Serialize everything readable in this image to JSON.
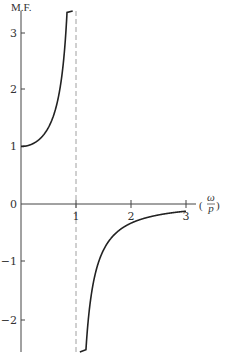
{
  "chart_data": {
    "type": "line",
    "title": "",
    "ylabel": "M.F.",
    "xlabel": "(ω/p)",
    "xlim": [
      0,
      3.1
    ],
    "ylim": [
      -2.6,
      3.35
    ],
    "grid": false,
    "legend": null,
    "x_ticks": [
      1,
      2,
      3
    ],
    "x_tick_labels": [
      "1",
      "2",
      "3"
    ],
    "y_ticks": [
      -2,
      -1,
      0,
      1,
      2,
      3
    ],
    "y_tick_labels": [
      "−2",
      "−1",
      "0",
      "1",
      "2",
      "3"
    ],
    "function": "M.F. = 1 / (1 − (ω/p)²)",
    "asymptote": {
      "x": 1,
      "style": "dashed"
    },
    "series": [
      {
        "name": "below resonance",
        "x": [
          0,
          0.2,
          0.4,
          0.5,
          0.6,
          0.7,
          0.8,
          0.85,
          0.9
        ],
        "y": [
          1.0,
          1.04,
          1.19,
          1.33,
          1.56,
          1.96,
          2.78,
          3.6,
          5.26
        ]
      },
      {
        "name": "above resonance",
        "x": [
          1.1,
          1.2,
          1.4,
          1.6,
          1.8,
          2.0,
          2.5,
          3.0
        ],
        "y": [
          -4.76,
          -2.27,
          -1.04,
          -0.64,
          -0.45,
          -0.33,
          -0.19,
          -0.125
        ]
      }
    ]
  },
  "labels": {
    "y_axis_title": "M.F.",
    "x_axis_title_numerator": "ω",
    "x_axis_title_denominator": "p",
    "x_axis_title_open": "(",
    "x_axis_title_close": ")"
  }
}
